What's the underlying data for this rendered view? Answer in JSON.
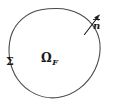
{
  "figure": {
    "background_color": "#ffffff",
    "stroke_color": "#4a4a4a",
    "text_color": "#1a1a1a",
    "width": 113,
    "height": 108
  },
  "labels": {
    "boundary": "Σ",
    "domain_symbol": "Ω",
    "domain_subscript": "F",
    "normal": "n"
  },
  "geometry": {
    "boundary_curve": {
      "type": "closed-blob",
      "center_x": 55,
      "center_y": 54,
      "radius_x": 48,
      "radius_y": 45,
      "rotation_deg": -18
    },
    "normal_vector": {
      "tail_x": 84,
      "tail_y": 34,
      "head_x": 99,
      "head_y": 15
    }
  }
}
